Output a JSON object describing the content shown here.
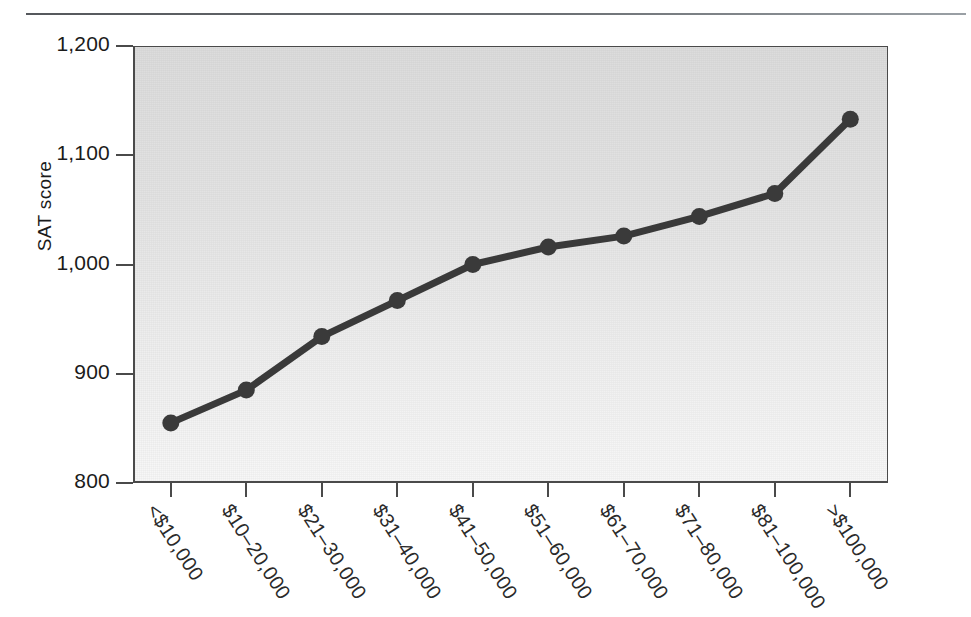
{
  "figure": {
    "has_top_rule": true,
    "plot_bg_top": "#dcdcdc",
    "plot_bg_bottom": "#f7f7f7",
    "frame_color": "#4a4a4a",
    "series_color": "#3a3a3a"
  },
  "chart_data": {
    "type": "line",
    "title": "",
    "xlabel": "",
    "ylabel": "SAT score",
    "ylim": [
      800,
      1200
    ],
    "yticks": [
      800,
      900,
      1000,
      1100,
      1200
    ],
    "ytick_labels": [
      "800",
      "900",
      "1,000",
      "1,100",
      "1,200"
    ],
    "grid": false,
    "legend": false,
    "marker": "circle",
    "categories": [
      "<$10,000",
      "$10–20,000",
      "$21–30,000",
      "$31–40,000",
      "$41–50,000",
      "$51–60,000",
      "$61–70,000",
      "$71–80,000",
      "$81–100,000",
      ">$100,000"
    ],
    "values": [
      855,
      885,
      934,
      967,
      1000,
      1016,
      1026,
      1044,
      1065,
      1133
    ]
  }
}
